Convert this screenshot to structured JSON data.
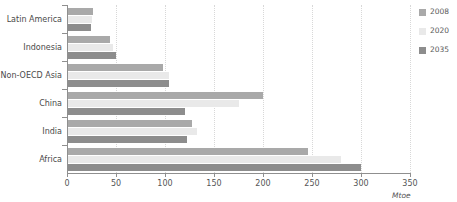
{
  "chart_data": {
    "type": "bar",
    "orientation": "horizontal",
    "title": "",
    "subtitle": "",
    "xlabel": "Mtoe",
    "ylabel": "",
    "xlim": [
      0,
      350
    ],
    "xticks": [
      0,
      50,
      100,
      150,
      200,
      250,
      300,
      350
    ],
    "xtick_labels": [
      "0",
      "50",
      "100",
      "150",
      "200",
      "250",
      "300",
      "350"
    ],
    "grid": true,
    "grid_axis": "x",
    "legend_position": "right",
    "categories": [
      "Latin America",
      "Indonesia",
      "Non-OECD Asia",
      "China",
      "India",
      "Africa"
    ],
    "series": [
      {
        "name": "2008",
        "color": "#a9a9a9",
        "values": [
          27,
          44,
          98,
          200,
          128,
          246
        ]
      },
      {
        "name": "2020",
        "color": "#e9e9e9",
        "values": [
          26,
          47,
          104,
          176,
          133,
          280
        ]
      },
      {
        "name": "2035",
        "color": "#8d8d8d",
        "values": [
          24,
          50,
          104,
          120,
          122,
          300
        ]
      }
    ]
  },
  "legend": {
    "items": [
      {
        "label": "2008",
        "color": "#a9a9a9"
      },
      {
        "label": "2020",
        "color": "#e9e9e9"
      },
      {
        "label": "2035",
        "color": "#8d8d8d"
      }
    ]
  },
  "axis": {
    "unit_label": "Mtoe"
  },
  "colors": {
    "axis": "#8f8f8f",
    "grid": "#d8d8d8",
    "text": "#555555",
    "background": "#ffffff"
  }
}
